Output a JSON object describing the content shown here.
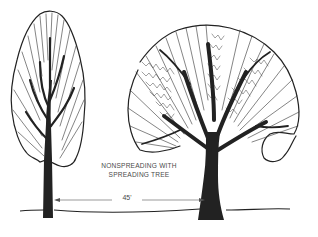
{
  "illustration": {
    "caption_line1": "NONSPREADING WITH",
    "caption_line2": "SPREADING TREE",
    "spacing_label": "45'",
    "trees": [
      {
        "name": "nonspreading tree",
        "form": "columnar / oval"
      },
      {
        "name": "spreading tree",
        "form": "rounded / broad"
      }
    ],
    "colors": {
      "ink": "#222222",
      "background": "#ffffff",
      "label": "#4a4a4a"
    }
  }
}
